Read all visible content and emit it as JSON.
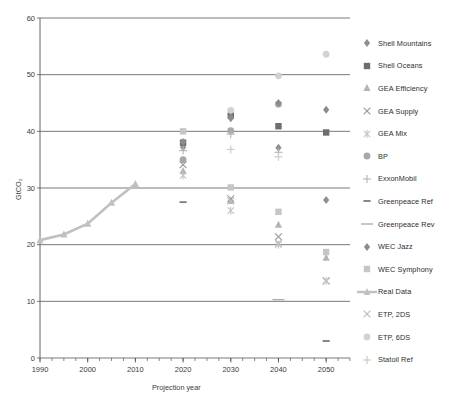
{
  "chart_data": {
    "type": "scatter",
    "title": "",
    "xlabel": "Projection year",
    "ylabel": "GtCO2",
    "ylabel_display": "GtCO₂",
    "xlim": [
      1990,
      2055
    ],
    "ylim": [
      0,
      60
    ],
    "ytick_values": [
      0,
      10,
      20,
      30,
      40,
      50,
      60
    ],
    "ytick_labels": [
      "0",
      "10",
      "20",
      "30",
      "40",
      "50",
      "60"
    ],
    "xtick_values": [
      1990,
      2000,
      2010,
      2020,
      2030,
      2040,
      2050
    ],
    "xtick_labels": [
      "1990",
      "2000",
      "2010",
      "2020",
      "2030",
      "2040",
      "2050"
    ],
    "grid": "horizontal",
    "legend_position": "right",
    "series": [
      {
        "name": "Shell Mountains",
        "marker": "diamond",
        "color": "#8f8f8f",
        "points": [
          {
            "x": 2020,
            "y": 37.2
          },
          {
            "x": 2030,
            "y": 42.3
          },
          {
            "x": 2040,
            "y": 37.1
          },
          {
            "x": 2050,
            "y": 27.9
          }
        ]
      },
      {
        "name": "Shell Oceans",
        "marker": "square",
        "color": "#6e6e6e",
        "points": [
          {
            "x": 2020,
            "y": 38.0
          },
          {
            "x": 2030,
            "y": 42.8
          },
          {
            "x": 2040,
            "y": 40.9
          },
          {
            "x": 2050,
            "y": 39.8
          }
        ]
      },
      {
        "name": "GEA Efficiency",
        "marker": "triangle",
        "color": "#b4b4b4",
        "points": [
          {
            "x": 2020,
            "y": 33.0
          },
          {
            "x": 2030,
            "y": 27.7
          },
          {
            "x": 2040,
            "y": 23.5
          },
          {
            "x": 2050,
            "y": 17.7
          }
        ]
      },
      {
        "name": "GEA Supply",
        "marker": "x-cross",
        "color": "#9a9a9a",
        "points": [
          {
            "x": 2020,
            "y": 34.1
          },
          {
            "x": 2030,
            "y": 28.1
          },
          {
            "x": 2040,
            "y": 21.4
          },
          {
            "x": 2050,
            "y": 13.6
          }
        ]
      },
      {
        "name": "GEA Mix",
        "marker": "star-cross",
        "color": "#c2c2c2",
        "points": [
          {
            "x": 2020,
            "y": 32.2
          },
          {
            "x": 2030,
            "y": 26.0
          },
          {
            "x": 2040,
            "y": 20.0
          },
          {
            "x": 2050,
            "y": 13.6
          }
        ]
      },
      {
        "name": "BP",
        "marker": "circle",
        "color": "#a8a8a8",
        "points": [
          {
            "x": 2020,
            "y": 35.0
          },
          {
            "x": 2030,
            "y": 40.1
          },
          {
            "x": 2040,
            "y": 44.8
          }
        ]
      },
      {
        "name": "ExxonMobil",
        "marker": "plus",
        "color": "#b9b9b9",
        "points": [
          {
            "x": 2020,
            "y": 36.6
          },
          {
            "x": 2030,
            "y": 39.5
          },
          {
            "x": 2040,
            "y": 36.3
          }
        ]
      },
      {
        "name": "Greenpeace Ref",
        "marker": "dash-short",
        "color": "#7a7a7a",
        "points": [
          {
            "x": 2020,
            "y": 27.5
          },
          {
            "x": 2050,
            "y": 3.0
          }
        ]
      },
      {
        "name": "Greenpeace Rev",
        "marker": "dash-long",
        "color": "#b0b0b0",
        "points": [
          {
            "x": 2040,
            "y": 10.3
          }
        ]
      },
      {
        "name": "WEC Jazz",
        "marker": "diamond",
        "color": "#8c8c8c",
        "points": [
          {
            "x": 2020,
            "y": 38.1
          },
          {
            "x": 2030,
            "y": 42.5
          },
          {
            "x": 2040,
            "y": 45.0
          },
          {
            "x": 2050,
            "y": 43.8
          }
        ]
      },
      {
        "name": "WEC Symphony",
        "marker": "square",
        "color": "#c6c6c6",
        "points": [
          {
            "x": 2020,
            "y": 40.0
          },
          {
            "x": 2030,
            "y": 30.1
          },
          {
            "x": 2040,
            "y": 25.8
          },
          {
            "x": 2050,
            "y": 18.7
          }
        ]
      },
      {
        "name": "Real Data",
        "marker": "line-triangle",
        "color": "#c0c0c0",
        "points": [
          {
            "x": 1990,
            "y": 20.8
          },
          {
            "x": 1995,
            "y": 21.8
          },
          {
            "x": 2000,
            "y": 23.7
          },
          {
            "x": 2005,
            "y": 27.4
          },
          {
            "x": 2010,
            "y": 30.7
          }
        ]
      },
      {
        "name": "ETP, 2DS",
        "marker": "x-cross",
        "color": "#bdbdbd",
        "points": [
          {
            "x": 2030,
            "y": 27.7
          },
          {
            "x": 2040,
            "y": 20.3
          }
        ]
      },
      {
        "name": "ETP, 6DS",
        "marker": "circle",
        "color": "#d2d2d2",
        "points": [
          {
            "x": 2030,
            "y": 43.7
          },
          {
            "x": 2040,
            "y": 49.8
          },
          {
            "x": 2050,
            "y": 53.6
          }
        ]
      },
      {
        "name": "Statoil Ref",
        "marker": "plus",
        "color": "#cccccc",
        "points": [
          {
            "x": 2030,
            "y": 36.8
          },
          {
            "x": 2040,
            "y": 35.5
          }
        ]
      }
    ]
  },
  "axes": {
    "y_title": "GtCO₂",
    "x_title": "Projection year"
  },
  "legend": {
    "items": [
      {
        "label": "Shell Mountains",
        "marker": "diamond",
        "color": "#8f8f8f"
      },
      {
        "label": "Shell Oceans",
        "marker": "square",
        "color": "#6e6e6e"
      },
      {
        "label": "GEA Efficiency",
        "marker": "triangle",
        "color": "#b4b4b4"
      },
      {
        "label": "GEA Supply",
        "marker": "x-cross",
        "color": "#9a9a9a"
      },
      {
        "label": "GEA Mix",
        "marker": "star-cross",
        "color": "#c2c2c2"
      },
      {
        "label": "BP",
        "marker": "circle",
        "color": "#a8a8a8"
      },
      {
        "label": "ExxonMobil",
        "marker": "plus",
        "color": "#b9b9b9"
      },
      {
        "label": "Greenpeace Ref",
        "marker": "dash-short",
        "color": "#7a7a7a"
      },
      {
        "label": "Greenpeace Rev",
        "marker": "dash-long",
        "color": "#b0b0b0"
      },
      {
        "label": "WEC Jazz",
        "marker": "diamond",
        "color": "#8c8c8c"
      },
      {
        "label": "WEC Symphony",
        "marker": "square",
        "color": "#c6c6c6"
      },
      {
        "label": "Real Data",
        "marker": "line-triangle",
        "color": "#c0c0c0"
      },
      {
        "label": "ETP, 2DS",
        "marker": "x-cross",
        "color": "#bdbdbd"
      },
      {
        "label": "ETP, 6DS",
        "marker": "circle",
        "color": "#d2d2d2"
      },
      {
        "label": "Statoil Ref",
        "marker": "plus",
        "color": "#cccccc"
      }
    ]
  }
}
